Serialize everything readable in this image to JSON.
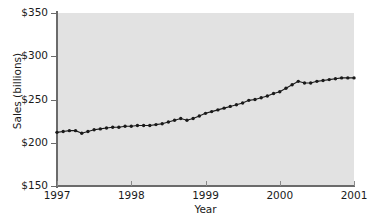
{
  "chart_data": {
    "type": "line",
    "title": "",
    "xlabel": "Year",
    "ylabel": "Sales (billions)",
    "xlim": [
      1997,
      2001
    ],
    "ylim": [
      150,
      350
    ],
    "grid": false,
    "legend": null,
    "marker": "filled-circle",
    "line_color": "#1a1a1a",
    "marker_color": "#1a1a1a",
    "plot_background": "#e2e2e2",
    "figure_background": "#ffffff",
    "x_tick_labels": [
      "1997",
      "1998",
      "1999",
      "2000",
      "2001"
    ],
    "x_tick_values": [
      1997,
      1998,
      1999,
      2000,
      2001
    ],
    "y_tick_labels": [
      "$150",
      "$200",
      "$250",
      "$300",
      "$350"
    ],
    "y_tick_values": [
      150,
      200,
      250,
      300,
      350
    ],
    "x_unit": "year (monthly observations)",
    "y_unit": "billions of dollars",
    "series": [
      {
        "name": "Sales",
        "x": [
          1997.0,
          1997.0833,
          1997.1667,
          1997.25,
          1997.3333,
          1997.4167,
          1997.5,
          1997.5833,
          1997.6667,
          1997.75,
          1997.8333,
          1997.9167,
          1998.0,
          1998.0833,
          1998.1667,
          1998.25,
          1998.3333,
          1998.4167,
          1998.5,
          1998.5833,
          1998.6667,
          1998.75,
          1998.8333,
          1998.9167,
          1999.0,
          1999.0833,
          1999.1667,
          1999.25,
          1999.3333,
          1999.4167,
          1999.5,
          1999.5833,
          1999.6667,
          1999.75,
          1999.8333,
          1999.9167,
          2000.0,
          2000.0833,
          2000.1667,
          2000.25,
          2000.3333,
          2000.4167,
          2000.5,
          2000.5833,
          2000.6667,
          2000.75,
          2000.8333,
          2000.9167,
          2001.0
        ],
        "values": [
          212,
          213,
          214,
          214,
          211,
          213,
          215,
          216,
          217,
          218,
          218,
          219,
          219,
          220,
          220,
          220,
          221,
          222,
          224,
          226,
          228,
          226,
          228,
          231,
          234,
          236,
          238,
          240,
          242,
          244,
          246,
          249,
          250,
          252,
          254,
          257,
          259,
          263,
          267,
          271,
          269,
          269,
          271,
          272,
          273,
          274,
          275,
          275,
          275
        ]
      }
    ]
  }
}
